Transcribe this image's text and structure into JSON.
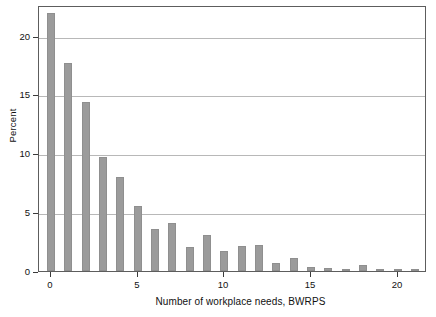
{
  "chart_data": {
    "type": "bar",
    "title": "",
    "subtitle": "",
    "xlabel": "Number of workplace needs, BWRPS",
    "ylabel": "Percent",
    "categories": [
      0,
      1,
      2,
      3,
      4,
      5,
      6,
      7,
      8,
      9,
      10,
      11,
      12,
      13,
      14,
      15,
      16,
      17,
      18,
      19,
      20,
      21
    ],
    "values": [
      21.9,
      17.7,
      14.4,
      9.7,
      8.0,
      5.5,
      3.6,
      4.1,
      2.0,
      3.1,
      1.7,
      2.1,
      2.2,
      0.7,
      1.1,
      0.3,
      0.25,
      0.1,
      0.5,
      0.15,
      0.07,
      0.12
    ],
    "xtick_labels": [
      "0",
      "5",
      "10",
      "15",
      "20"
    ],
    "xtick_values": [
      0,
      5,
      10,
      15,
      20
    ],
    "ytick_labels": [
      "0",
      "5",
      "10",
      "15",
      "20"
    ],
    "ytick_values": [
      0,
      5,
      10,
      15,
      20
    ],
    "xlim": [
      -0.7,
      21.7
    ],
    "ylim": [
      0,
      22.6
    ],
    "grid": "horizontal",
    "legend": "none",
    "bar_color": "#9b9b9b",
    "bar_edge_color": "#8f8f8f",
    "grid_color": "#b8b8b8",
    "frame_color": "#5d5d5d",
    "background": "#ffffff",
    "text_color": "#111111"
  }
}
